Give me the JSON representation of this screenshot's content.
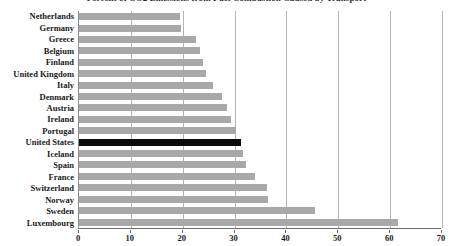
{
  "chart_data": {
    "type": "bar",
    "orientation": "horizontal",
    "title": "Percent of CO2 Emissions from Fuel Combustion Caused by Transport",
    "xlabel": "",
    "ylabel": "",
    "xlim": [
      0,
      70
    ],
    "xticks": [
      0,
      10,
      20,
      30,
      40,
      50,
      60,
      70
    ],
    "grid": true,
    "grid_axis": "x",
    "legend": null,
    "categories": [
      "Netherlands",
      "Germany",
      "Greece",
      "Belgium",
      "Finland",
      "United Kingdom",
      "Italy",
      "Denmark",
      "Austria",
      "Ireland",
      "Portugal",
      "United States",
      "Iceland",
      "Spain",
      "France",
      "Switzerland",
      "Norway",
      "Sweden",
      "Luxembourg"
    ],
    "values": [
      19.4,
      19.6,
      22.6,
      23.3,
      24.0,
      24.5,
      25.8,
      27.5,
      28.5,
      29.3,
      30.2,
      31.2,
      31.6,
      32.3,
      34.0,
      36.2,
      36.5,
      45.5,
      61.5
    ],
    "highlight_category": "United States",
    "colors": {
      "bar": "#a8a8a8",
      "highlight_bar": "#0b0b0b",
      "grid": "#b4b4b4",
      "axis": "#6e6e6e",
      "text": "#1a1a1a",
      "background": "#ffffff"
    }
  }
}
